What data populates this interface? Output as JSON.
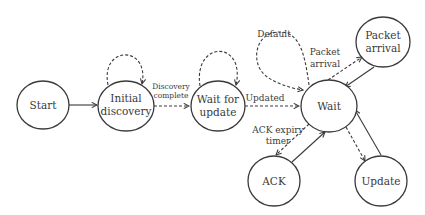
{
  "diagram": {
    "type": "state-machine",
    "nodes": [
      {
        "id": "start",
        "label_lines": [
          "Start"
        ]
      },
      {
        "id": "initial_discovery",
        "label_lines": [
          "Initial",
          "discovery"
        ]
      },
      {
        "id": "wait_for_update",
        "label_lines": [
          "Wait for",
          "update"
        ]
      },
      {
        "id": "wait",
        "label_lines": [
          "Wait"
        ]
      },
      {
        "id": "packet_arrival",
        "label_lines": [
          "Packet",
          "arrival"
        ]
      },
      {
        "id": "ack",
        "label_lines": [
          "ACK"
        ]
      },
      {
        "id": "update",
        "label_lines": [
          "Update"
        ]
      }
    ],
    "edges": [
      {
        "from": "start",
        "to": "initial_discovery",
        "style": "solid",
        "label": ""
      },
      {
        "from": "initial_discovery",
        "to": "initial_discovery",
        "style": "dashed",
        "label": ""
      },
      {
        "from": "initial_discovery",
        "to": "wait_for_update",
        "style": "dashed",
        "label_lines": [
          "Discovery",
          "complete"
        ]
      },
      {
        "from": "wait_for_update",
        "to": "wait_for_update",
        "style": "dashed",
        "label": ""
      },
      {
        "from": "wait_for_update",
        "to": "wait",
        "style": "dashed",
        "label": "Updated"
      },
      {
        "from": "wait",
        "to": "wait",
        "style": "dashed",
        "label": "Default"
      },
      {
        "from": "wait",
        "to": "packet_arrival",
        "style": "dashed",
        "label_lines": [
          "Packet",
          "arrival"
        ]
      },
      {
        "from": "packet_arrival",
        "to": "wait",
        "style": "solid",
        "label": ""
      },
      {
        "from": "wait",
        "to": "ack",
        "style": "dashed",
        "label_lines": [
          "ACK expiry",
          "timer"
        ]
      },
      {
        "from": "ack",
        "to": "wait",
        "style": "solid",
        "label": ""
      },
      {
        "from": "wait",
        "to": "update",
        "style": "dashed",
        "label": ""
      },
      {
        "from": "update",
        "to": "wait",
        "style": "solid",
        "label": ""
      }
    ]
  },
  "labels": {
    "start": "Start",
    "initial_1": "Initial",
    "initial_2": "discovery",
    "wfu_1": "Wait for",
    "wfu_2": "update",
    "wait": "Wait",
    "packet_1": "Packet",
    "packet_2": "arrival",
    "ack": "ACK",
    "update": "Update",
    "edge_discovery_1": "Discovery",
    "edge_discovery_2": "complete",
    "edge_updated": "Updated",
    "edge_default": "Default",
    "edge_packet_1": "Packet",
    "edge_packet_2": "arrival",
    "edge_ack_1": "ACK expiry",
    "edge_ack_2": "timer"
  }
}
